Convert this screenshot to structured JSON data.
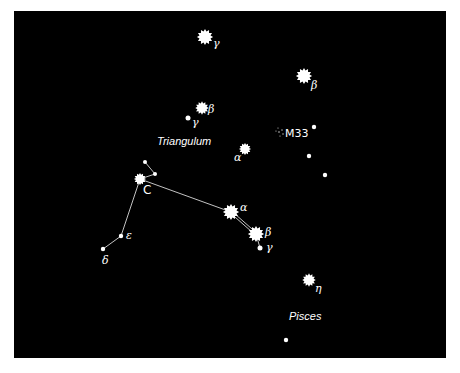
{
  "chart": {
    "background": "#000000",
    "star_color": "#ffffff",
    "line_color": "#dddddd"
  },
  "constellations": {
    "triangulum": "Triangulum",
    "pisces": "Pisces"
  },
  "objects": {
    "m33": "M33"
  },
  "labels": {
    "and_gamma": "γ",
    "and_beta": "β",
    "tri_beta": "β",
    "tri_gamma": "γ",
    "tri_alpha": "α",
    "ari_alpha": "α",
    "ari_beta": "β",
    "ari_gamma": "γ",
    "c_label": "C",
    "epsilon": "ε",
    "delta": "δ",
    "psc_eta": "η"
  },
  "stars": [
    {
      "id": "and_gamma",
      "x": 205,
      "y": 37,
      "r": 6,
      "type": "spiky"
    },
    {
      "id": "and_beta",
      "x": 304,
      "y": 76,
      "r": 6,
      "type": "spiky"
    },
    {
      "id": "tri_beta",
      "x": 202,
      "y": 108,
      "r": 5,
      "type": "spiky"
    },
    {
      "id": "tri_gamma",
      "x": 188,
      "y": 118,
      "r": 2.5,
      "type": "dot"
    },
    {
      "id": "tri_alpha",
      "x": 245,
      "y": 149,
      "r": 4.5,
      "type": "spiky"
    },
    {
      "id": "dot_r1",
      "x": 314,
      "y": 127,
      "r": 2.2,
      "type": "dot"
    },
    {
      "id": "dot_r2",
      "x": 309,
      "y": 156,
      "r": 2.2,
      "type": "dot"
    },
    {
      "id": "dot_r3",
      "x": 325,
      "y": 175,
      "r": 2.2,
      "type": "dot"
    },
    {
      "id": "c_main",
      "x": 140,
      "y": 179,
      "r": 4.5,
      "type": "spiky"
    },
    {
      "id": "c_top",
      "x": 145,
      "y": 162,
      "r": 2,
      "type": "dot"
    },
    {
      "id": "c_right",
      "x": 155,
      "y": 174,
      "r": 2,
      "type": "dot"
    },
    {
      "id": "epsilon",
      "x": 121,
      "y": 236,
      "r": 2.2,
      "type": "dot"
    },
    {
      "id": "delta",
      "x": 103,
      "y": 249,
      "r": 2.2,
      "type": "dot"
    },
    {
      "id": "ari_alpha",
      "x": 231,
      "y": 212,
      "r": 6,
      "type": "spiky"
    },
    {
      "id": "ari_beta",
      "x": 256,
      "y": 234,
      "r": 6,
      "type": "spiky"
    },
    {
      "id": "ari_gamma",
      "x": 260,
      "y": 248,
      "r": 2.5,
      "type": "dot"
    },
    {
      "id": "psc_eta",
      "x": 309,
      "y": 280,
      "r": 5,
      "type": "spiky"
    },
    {
      "id": "psc_dot",
      "x": 286,
      "y": 340,
      "r": 2.2,
      "type": "dot"
    }
  ]
}
